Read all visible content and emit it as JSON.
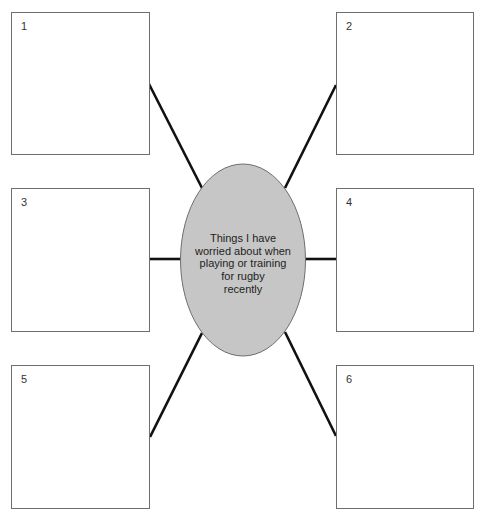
{
  "diagram": {
    "center": {
      "label_lines": [
        "Things I have",
        "worried about when",
        "playing or training",
        "for rugby",
        "recently"
      ],
      "fill": "#c6c6c6",
      "stroke": "#6e6e6e"
    },
    "boxes": [
      {
        "number": "1"
      },
      {
        "number": "2"
      },
      {
        "number": "3"
      },
      {
        "number": "4"
      },
      {
        "number": "5"
      },
      {
        "number": "6"
      }
    ],
    "connector_color": "#111111"
  }
}
